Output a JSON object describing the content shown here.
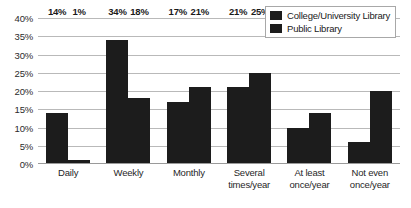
{
  "chart_data": {
    "type": "bar",
    "title": "",
    "xlabel": "",
    "ylabel": "",
    "ylim": [
      0,
      40
    ],
    "ytick_labels": [
      "40%",
      "35%",
      "30%",
      "25%",
      "20%",
      "15%",
      "10%",
      "5%",
      "0%"
    ],
    "ytick_values": [
      40,
      35,
      30,
      25,
      20,
      15,
      10,
      5,
      0
    ],
    "grid": true,
    "legend_position": "top-right",
    "categories": [
      "Daily",
      "Weekly",
      "Monthly",
      "Several times/year",
      "At least once/year",
      "Not even once/year"
    ],
    "category_lines": [
      [
        "Daily"
      ],
      [
        "Weekly"
      ],
      [
        "Monthly"
      ],
      [
        "Several",
        "times/year"
      ],
      [
        "At least",
        "once/year"
      ],
      [
        "Not even",
        "once/year"
      ]
    ],
    "series": [
      {
        "name": "College/University Library",
        "color": "#1c1c1c",
        "values": [
          14,
          34,
          17,
          21,
          10,
          6
        ],
        "labels": [
          "14%",
          "34%",
          "17%",
          "21%",
          "10%",
          "6%"
        ]
      },
      {
        "name": "Public Library",
        "color": "#1c1c1c",
        "values": [
          1,
          18,
          21,
          25,
          14,
          20
        ],
        "labels": [
          "1%",
          "18%",
          "21%",
          "25%",
          "14%",
          "20%"
        ]
      }
    ]
  }
}
